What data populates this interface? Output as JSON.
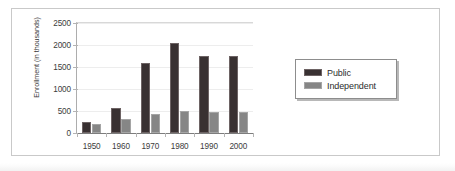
{
  "chart_data": {
    "type": "bar",
    "title": "",
    "xlabel": "",
    "ylabel": "Enrollment (in thousands)",
    "categories": [
      "1950",
      "1960",
      "1970",
      "1980",
      "1990",
      "2000"
    ],
    "series": [
      {
        "name": "Public",
        "color": "#393132",
        "values": [
          250,
          560,
          1590,
          2050,
          1750,
          1750
        ]
      },
      {
        "name": "Independent",
        "color": "#868686",
        "values": [
          200,
          320,
          440,
          490,
          470,
          480
        ]
      }
    ],
    "ylim": [
      0,
      2500
    ],
    "yticks": [
      0,
      500,
      1000,
      1500,
      2000,
      2500
    ],
    "ytick_labels": [
      "0",
      "500",
      "1000",
      "1500",
      "2000",
      "2500"
    ],
    "grid": true,
    "legend_position": "right-outside"
  },
  "legend": {
    "entries": [
      {
        "label": "Public",
        "swatch": "public-color-swatch"
      },
      {
        "label": "Independent",
        "swatch": "independent-color-swatch"
      }
    ]
  },
  "colors": {
    "public": "#393132",
    "independent": "#868686",
    "frame": "#c9c9c9",
    "axis": "#7d7d7d",
    "grid": "#ededed",
    "background": "#ffffff"
  }
}
